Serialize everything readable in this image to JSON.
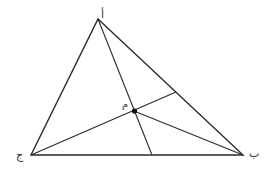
{
  "diagram": {
    "type": "triangle-with-concurrent-cevians",
    "stroke_color": "#2a2a2a",
    "point_color": "#111111",
    "vertices": {
      "A": {
        "label": "أ",
        "x": 98,
        "y": 19
      },
      "B": {
        "label": "ب",
        "x": 243,
        "y": 155
      },
      "C": {
        "label": "ج",
        "x": 31,
        "y": 155
      }
    },
    "center": {
      "label": "م",
      "x": 134,
      "y": 111
    },
    "cevian_feet": {
      "from_A_on_BC": {
        "x": 152,
        "y": 155
      },
      "from_C_on_AB": {
        "x": 176,
        "y": 92
      }
    },
    "labels": {
      "A": "أ",
      "B": "ب",
      "C": "ج",
      "M": "م"
    }
  }
}
